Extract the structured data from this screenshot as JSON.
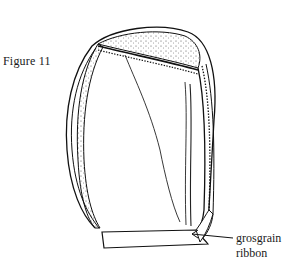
{
  "figure": {
    "label": "Figure 11",
    "callouts": [
      {
        "line1": "grosgrain",
        "line2": "ribbon"
      }
    ]
  }
}
